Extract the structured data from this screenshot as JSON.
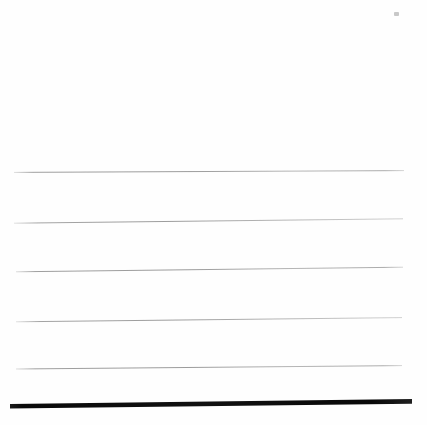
{
  "page": {
    "width": 427,
    "height": 425,
    "background_color": "#ffffff",
    "paper_color": "#fefefe",
    "content_text": ""
  },
  "colors": {
    "thin_rule": "#8e8e8e",
    "thin_rule_light": "#b9b9b9",
    "thin_rule_faint": "#d6d6d6",
    "thick_rule": "#0d0d0d",
    "speck": "#9a9a9a",
    "paper": "#fefefe"
  },
  "blank_region": {
    "label": "",
    "top": 0,
    "height": 160
  },
  "artifacts": [
    {
      "name": "scan-speck",
      "x": 394,
      "y": 12,
      "width": 5,
      "height": 4,
      "color": "#9a9a9a",
      "opacity": 0.55
    }
  ],
  "rules": [
    {
      "id": "rule-1",
      "kind": "thin",
      "x1": 14,
      "y1": 172.4,
      "x2": 404,
      "y2": 170.6,
      "stroke": "#8e8e8e",
      "stroke_light": "#c4c4c4",
      "width": 0.9,
      "opacity": 0.95
    },
    {
      "id": "rule-2",
      "kind": "thin",
      "x1": 14,
      "y1": 223.2,
      "x2": 403,
      "y2": 218.8,
      "stroke": "#8e8e8e",
      "stroke_light": "#c4c4c4",
      "width": 0.9,
      "opacity": 0.95
    },
    {
      "id": "rule-3",
      "kind": "thin",
      "x1": 16,
      "y1": 271.8,
      "x2": 403,
      "y2": 267.2,
      "stroke": "#8e8e8e",
      "stroke_light": "#c4c4c4",
      "width": 0.9,
      "opacity": 0.95
    },
    {
      "id": "rule-4",
      "kind": "thin",
      "x1": 16,
      "y1": 321.8,
      "x2": 402,
      "y2": 317.6,
      "stroke": "#8e8e8e",
      "stroke_light": "#c4c4c4",
      "width": 0.9,
      "opacity": 0.95
    },
    {
      "id": "rule-5",
      "kind": "thin",
      "x1": 16,
      "y1": 369.0,
      "x2": 402,
      "y2": 365.6,
      "stroke": "#8e8e8e",
      "stroke_light": "#c4c4c4",
      "width": 0.9,
      "opacity": 0.95
    },
    {
      "id": "rule-6",
      "kind": "thick",
      "x1": 10,
      "y1": 406.2,
      "x2": 412,
      "y2": 401.4,
      "stroke": "#0d0d0d",
      "stroke_light": "#2a2a2a",
      "width": 4.6,
      "opacity": 1
    }
  ],
  "rule_count": {
    "thin": 5,
    "thick": 1,
    "total": 6
  }
}
